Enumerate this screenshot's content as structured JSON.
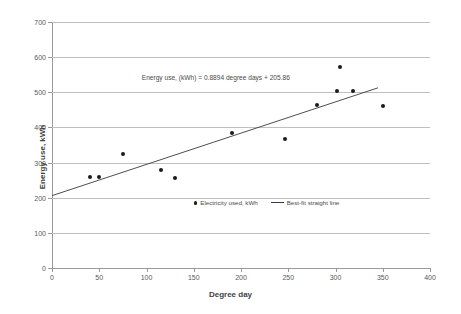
{
  "chart_data": {
    "type": "scatter",
    "title": "",
    "xlabel": "Degree day",
    "ylabel": "Energy use, kWh",
    "xlim": [
      0,
      400
    ],
    "ylim": [
      0,
      700
    ],
    "xticks": [
      0,
      50,
      100,
      150,
      200,
      250,
      300,
      350,
      400
    ],
    "yticks": [
      0,
      100,
      200,
      300,
      400,
      500,
      600,
      700
    ],
    "grid": "horizontal",
    "legend_position": "inside-lower-center",
    "annotation": "Energy use, (kWh) = 0.8894 degree days + 205.86",
    "series": [
      {
        "name": "Electricity used, kWh",
        "marker": "dot",
        "color": "#1a1a1a",
        "points": [
          {
            "x": 40,
            "y": 258
          },
          {
            "x": 50,
            "y": 260
          },
          {
            "x": 75,
            "y": 325
          },
          {
            "x": 115,
            "y": 278
          },
          {
            "x": 130,
            "y": 255
          },
          {
            "x": 190,
            "y": 383
          },
          {
            "x": 247,
            "y": 368
          },
          {
            "x": 280,
            "y": 463
          },
          {
            "x": 305,
            "y": 573
          },
          {
            "x": 302,
            "y": 503
          },
          {
            "x": 318,
            "y": 505
          },
          {
            "x": 350,
            "y": 460
          }
        ]
      }
    ],
    "fit_line": {
      "name": "Best-fit straight line",
      "slope": 0.8894,
      "intercept": 205.86,
      "color": "#3a3a3a",
      "x_start": 0,
      "x_end": 345
    }
  },
  "legend": {
    "items": [
      {
        "label": "Electricity used, kWh",
        "marker": "dot"
      },
      {
        "label": "Best-fit straight line",
        "marker": "line"
      }
    ]
  }
}
